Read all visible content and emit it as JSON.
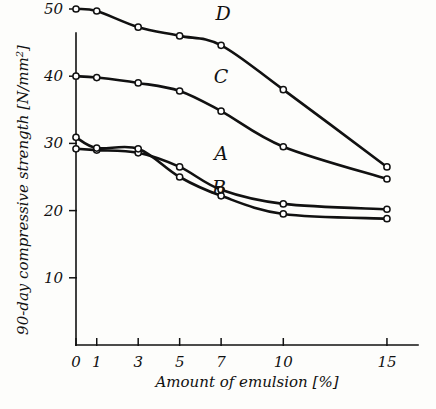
{
  "chart_data": {
    "type": "line",
    "title": "",
    "xlabel": "Amount of emulsion   [%]",
    "ylabel": "90-day compressive strength  [N/mm²]",
    "ylabel_main": "90-day compressive strength  [N/mm",
    "ylabel_sup": "2",
    "ylabel_tail": "]",
    "x": [
      0,
      1,
      3,
      5,
      7,
      10,
      15
    ],
    "xticks": [
      0,
      1,
      3,
      5,
      7,
      10,
      15
    ],
    "xtick_labels": [
      "0",
      "1",
      "3",
      "5",
      "7",
      "10",
      "15"
    ],
    "yticks": [
      10,
      20,
      30,
      40,
      50
    ],
    "ytick_labels": [
      "10",
      "20",
      "30",
      "40",
      "50"
    ],
    "xlim": [
      0,
      16.5
    ],
    "ylim": [
      0,
      53
    ],
    "grid": false,
    "legend": "inline-curve-labels",
    "marker": "open-circle",
    "line_color": "#111111",
    "series": [
      {
        "name": "A",
        "label": "A",
        "label_x": 7.0,
        "label_y": 27.6,
        "values": [
          29.2,
          29.0,
          28.6,
          26.5,
          23.1,
          21.0,
          20.2
        ]
      },
      {
        "name": "B",
        "label": "B",
        "label_x": 6.9,
        "label_y": 22.4,
        "values": [
          30.9,
          29.3,
          29.2,
          25.0,
          22.2,
          19.5,
          18.8
        ]
      },
      {
        "name": "C",
        "label": "C",
        "label_x": 7.0,
        "label_y": 39.0,
        "values": [
          40.0,
          39.8,
          39.0,
          37.8,
          34.8,
          29.5,
          24.7
        ]
      },
      {
        "name": "D",
        "label": "D",
        "label_x": 7.1,
        "label_y": 48.3,
        "values": [
          50.0,
          49.7,
          47.3,
          46.0,
          44.6,
          38.0,
          26.5
        ]
      }
    ]
  }
}
